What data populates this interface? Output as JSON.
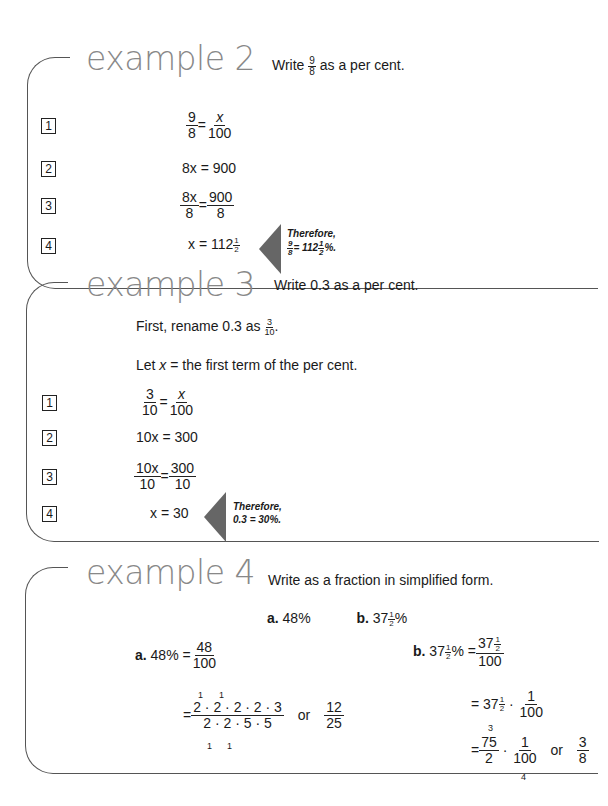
{
  "examples": [
    {
      "title": "example 2",
      "prompt": {
        "pre": "Write",
        "frac_num": "9",
        "frac_den": "8",
        "post": "as a per cent."
      },
      "steps": [
        {
          "n": "1",
          "lhs_num": "9",
          "lhs_den": "8",
          "rhs_num": "x",
          "rhs_den": "100"
        },
        {
          "n": "2",
          "text": "8x = 900"
        },
        {
          "n": "3",
          "lhs_num": "8x",
          "lhs_den": "8",
          "rhs_num": "900",
          "rhs_den": "8"
        },
        {
          "n": "4",
          "text": "x = 112",
          "mixed_num": "1",
          "mixed_den": "2"
        }
      ],
      "conclusion": {
        "line1": "Therefore,",
        "frac_num": "9",
        "frac_den": "8",
        "eq": "= 112",
        "m_num": "1",
        "m_den": "2",
        "suffix": "%."
      }
    },
    {
      "title": "example 3",
      "prompt": {
        "text": "Write 0.3 as a per cent."
      },
      "intro": {
        "pre": "First, rename 0.3 as",
        "frac_num": "3",
        "frac_den": "10",
        "post": "."
      },
      "let": {
        "pre": "Let",
        "var": "x",
        "post": "= the first term of the per cent."
      },
      "steps": [
        {
          "n": "1",
          "lhs_num": "3",
          "lhs_den": "10",
          "rhs_num": "x",
          "rhs_den": "100"
        },
        {
          "n": "2",
          "text": "10x = 300"
        },
        {
          "n": "3",
          "lhs_num": "10x",
          "lhs_den": "10",
          "rhs_num": "300",
          "rhs_den": "10"
        },
        {
          "n": "4",
          "text": "x = 30"
        }
      ],
      "conclusion": {
        "line1": "Therefore,",
        "line2": "0.3 = 30%."
      }
    },
    {
      "title": "example 4",
      "prompt": {
        "text": "Write as a fraction in simplified form."
      },
      "parts": {
        "a_label": "a.",
        "a_value": "48%",
        "b_label": "b.",
        "b_value": "37",
        "b_num": "1",
        "b_den": "2",
        "b_suffix": "%"
      },
      "solution_a": {
        "label": "a.",
        "lhs": "48% =",
        "num": "48",
        "den": "100",
        "factor_num": "2 · 2 · 2 · 2 · 3",
        "factor_den": "2 · 2 · 5 · 5",
        "cancel_marks": "1",
        "or": "or",
        "result_num": "12",
        "result_den": "25"
      },
      "solution_b": {
        "label": "b.",
        "lhs": "37",
        "lhs_suffix": "% =",
        "num_whole": "37",
        "den": "100",
        "line2_whole": "37",
        "line2_num": "1",
        "line2_den": "100",
        "line3_num": "75",
        "line3_den": "2",
        "line3_num2": "1",
        "line3_den2": "100",
        "cancel_top": "3",
        "cancel_bottom": "4",
        "or": "or",
        "result_num": "3",
        "result_den": "8",
        "half_num": "1",
        "half_den": "2",
        "dot": "·",
        "eq": "="
      }
    }
  ]
}
